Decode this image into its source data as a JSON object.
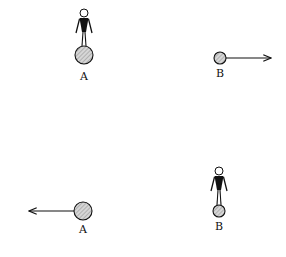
{
  "diagram": {
    "colors": {
      "ink": "#111111",
      "ball_fill": "#c8c8c8",
      "background": "#ffffff"
    },
    "panels": [
      {
        "id": "before",
        "objects": [
          {
            "label": "A",
            "type": "ball-with-person",
            "state": "person standing on ball, at rest"
          },
          {
            "label": "B",
            "type": "ball",
            "state": "moving right",
            "arrow": "right"
          }
        ]
      },
      {
        "id": "after",
        "objects": [
          {
            "label": "A",
            "type": "ball",
            "state": "moving left",
            "arrow": "left"
          },
          {
            "label": "B",
            "type": "ball-with-person",
            "state": "person standing on ball, at rest"
          }
        ]
      }
    ],
    "labels": {
      "top_a": "A",
      "top_b": "B",
      "bottom_a": "A",
      "bottom_b": "B"
    }
  }
}
